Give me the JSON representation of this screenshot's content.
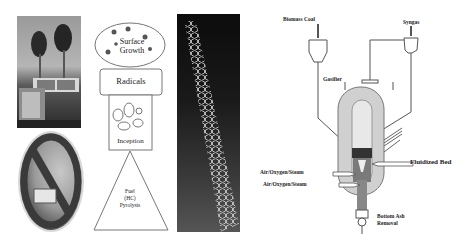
{
  "figure": {
    "panels": [
      {
        "id": "truck-photo",
        "description": "Truck emitting black smoke from exhaust stacks"
      },
      {
        "id": "no-smoking-oval",
        "description": "Oval prohibition sign over vehicle exhaust image"
      },
      {
        "id": "soot-formation-diagram",
        "description": "Soot formation stages"
      },
      {
        "id": "nanotube-image",
        "description": "Carbon nanotube hexagonal lattice rendering"
      },
      {
        "id": "gasifier-diagram",
        "description": "Fluidized bed gasifier schematic"
      }
    ],
    "soot_stages": {
      "surface_growth": "Surface\nGrowth",
      "surface_growth_line1": "Surface",
      "surface_growth_line2": "Growth",
      "radicals": "Radicals",
      "inception": "Inception",
      "pyrolysis_line1": "Fuel",
      "pyrolysis_line2": "(HC)",
      "pyrolysis_line3": "Pyrolysis"
    },
    "gasifier_labels": {
      "biomass_coal": "Biomass Coal",
      "syngas": "Syngas",
      "gasifier": "Gasifier",
      "fluidized_bed": "Fluidized Bed",
      "air_oxygen_steam_1": "Air/Oxygen/Steam",
      "air_oxygen_steam_2": "Air/Oxygen/Steam",
      "bottom_ash_line1": "Bottom Ash",
      "bottom_ash_line2": "Removal"
    },
    "colors": {
      "line": "#555555",
      "vessel_outer": "#d0d0d0",
      "vessel_inner": "#e6e6e6",
      "bed_dark": "#333333"
    }
  }
}
